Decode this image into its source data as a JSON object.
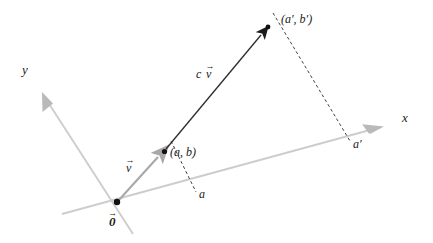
{
  "diagram": {
    "background_color": "#ffffff",
    "axes": {
      "x_label": "x",
      "y_label": "y",
      "axis_color": "#c9c9c9",
      "origin_label": "0",
      "origin_label_has_vector_arrow": true
    },
    "vectors": [
      {
        "name": "v",
        "label": "v",
        "has_vector_arrow": true,
        "color": "#a8a8a8",
        "tip_point_label": "(a, b)",
        "tip_dot_color": "#111111"
      },
      {
        "name": "cv",
        "label_scalar": "c",
        "label_vector": "v",
        "has_vector_arrow": true,
        "color": "#2b2b2b",
        "tip_point_label": "(a′, b′)",
        "tip_dot_color": "#111111"
      }
    ],
    "projections": [
      {
        "name": "a-projection",
        "tick_label": "a",
        "style": "dashed",
        "color": "#3a3a3a"
      },
      {
        "name": "a-prime-projection",
        "tick_label": "a′",
        "style": "dashed",
        "color": "#3a3a3a"
      }
    ],
    "labels": {
      "x_axis": "x",
      "y_axis": "y",
      "origin": "0",
      "v_vector": "v",
      "cv_scalar": "c",
      "cv_vector": "v",
      "point_ab": "(a, b)",
      "point_ab_prime": "(a′, b′)",
      "tick_a": "a",
      "tick_a_prime": "a′"
    }
  },
  "geometry": {
    "origin": {
      "x": 117,
      "y": 202
    },
    "x_axis_start": {
      "x": 62,
      "y": 214
    },
    "x_axis_end": {
      "x": 388,
      "y": 125
    },
    "x_arrow_tip": {
      "x": 392,
      "y": 124
    },
    "y_axis_end": {
      "x": 38,
      "y": 88
    },
    "y_axis_back": {
      "x": 130,
      "y": 230
    },
    "v_tip": {
      "x": 164,
      "y": 151
    },
    "cv_tip": {
      "x": 268,
      "y": 26
    },
    "a_foot": {
      "x": 194,
      "y": 190
    },
    "a_prime_foot": {
      "x": 349,
      "y": 139
    },
    "dash_top_a": {
      "x": 172,
      "y": 142
    },
    "dash_top_ap": {
      "x": 272,
      "y": 13
    }
  }
}
